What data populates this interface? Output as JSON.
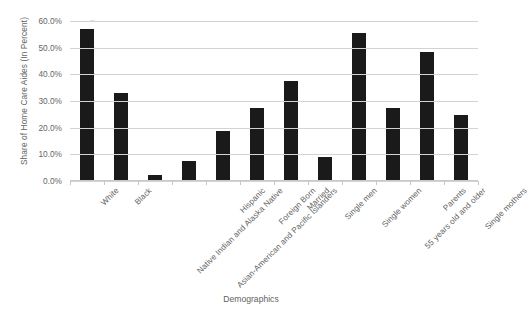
{
  "chart_data": {
    "type": "bar",
    "title": "",
    "xlabel": "Demographics",
    "ylabel": "Share of Home Care Aides (In Percent)",
    "ylim": [
      0,
      60
    ],
    "ytick_values": [
      0,
      10,
      20,
      30,
      40,
      50,
      60
    ],
    "ytick_labels": [
      "0.0%",
      "10.0%",
      "20.0%",
      "30.0%",
      "40.0%",
      "50.0%",
      "60.0%"
    ],
    "grid": true,
    "legend": "none",
    "bar_color": "#1a1a1a",
    "gridline_color": "#d3d3d3",
    "categories": [
      "White",
      "Black",
      "Native Indian and Alaska Native",
      "Asian-American and Pacific Islanders",
      "Hispanic",
      "Foreign Born",
      "Married",
      "Single men",
      "Single women",
      "55 years old and older",
      "Parents",
      "Single mothers"
    ],
    "values": [
      56.5,
      32.5,
      2.0,
      7.0,
      18.5,
      27.0,
      37.0,
      8.5,
      55.0,
      27.0,
      48.0,
      24.5
    ]
  }
}
